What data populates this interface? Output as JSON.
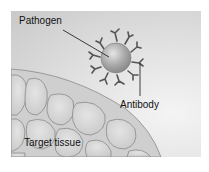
{
  "diagram": {
    "labels": {
      "pathogen": "Pathogen",
      "antibody": "Antibody",
      "target_tissue": "Target tissue"
    },
    "colors": {
      "background": "#d6d6d6",
      "pathogen_fill": "#a8a8a8",
      "antibody": "#555555",
      "tissue_cell": "#d8d8d8",
      "cell_outline": "#8a8a8a"
    }
  }
}
